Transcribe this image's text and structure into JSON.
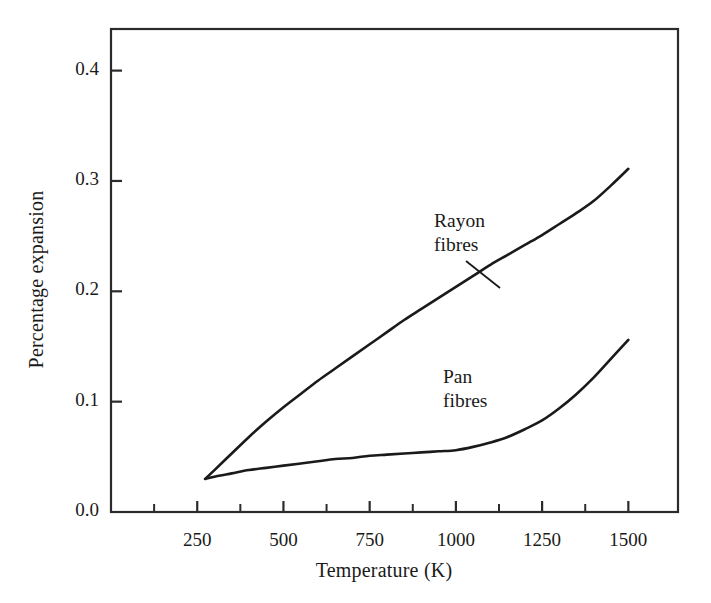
{
  "chart_data": {
    "type": "line",
    "title": "",
    "subtitle": "",
    "xlabel": "Temperature (K)",
    "ylabel": "Percentage expansion",
    "xlim": [
      0,
      1644
    ],
    "ylim": [
      0.0,
      0.4377
    ],
    "grid": false,
    "legend_position": "inline-annotation",
    "x_ticks": [
      250,
      500,
      750,
      1000,
      1250,
      1500
    ],
    "x_tick_labels": [
      "250",
      "500",
      "750",
      "1000",
      "1250",
      "1500"
    ],
    "x_minor_ticks": [
      125,
      375,
      625,
      875,
      1125,
      1375
    ],
    "y_ticks": [
      0.0,
      0.1,
      0.2,
      0.3,
      0.4
    ],
    "y_tick_labels": [
      "0.0",
      "0.1",
      "0.2",
      "0.3",
      "0.4"
    ],
    "frame": "box",
    "line_color": "#1a1a1a",
    "background_color": "#ffffff",
    "series": [
      {
        "name": "Rayon fibres",
        "label_lines": [
          "Rayon",
          "fibres"
        ],
        "has_leader_line": true,
        "x": [
          273,
          300,
          350,
          400,
          450,
          500,
          550,
          600,
          650,
          700,
          750,
          800,
          850,
          900,
          950,
          1000,
          1050,
          1100,
          1150,
          1200,
          1250,
          1300,
          1350,
          1400,
          1450,
          1500
        ],
        "y": [
          0.03,
          0.038,
          0.053,
          0.068,
          0.082,
          0.095,
          0.107,
          0.119,
          0.13,
          0.141,
          0.152,
          0.163,
          0.174,
          0.184,
          0.194,
          0.204,
          0.214,
          0.224,
          0.233,
          0.242,
          0.251,
          0.261,
          0.271,
          0.282,
          0.296,
          0.311
        ]
      },
      {
        "name": "Pan fibres",
        "label_lines": [
          "Pan",
          "fibres"
        ],
        "has_leader_line": false,
        "x": [
          273,
          300,
          350,
          400,
          450,
          500,
          550,
          600,
          650,
          700,
          750,
          800,
          850,
          900,
          950,
          1000,
          1050,
          1100,
          1150,
          1200,
          1250,
          1300,
          1350,
          1400,
          1450,
          1500
        ],
        "y": [
          0.03,
          0.032,
          0.035,
          0.038,
          0.04,
          0.042,
          0.044,
          0.046,
          0.048,
          0.049,
          0.051,
          0.052,
          0.053,
          0.054,
          0.055,
          0.056,
          0.059,
          0.063,
          0.068,
          0.075,
          0.083,
          0.094,
          0.107,
          0.122,
          0.139,
          0.156
        ]
      }
    ]
  },
  "annotations": {
    "rayon": {
      "lines": [
        "Rayon",
        "fibres"
      ]
    },
    "pan": {
      "lines": [
        "Pan",
        "fibres"
      ]
    }
  }
}
